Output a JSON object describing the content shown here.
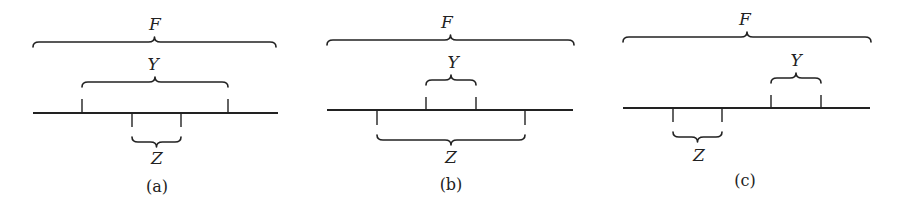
{
  "figure": {
    "panels": [
      {
        "caption": "(a)",
        "F_label": "F",
        "Y_label": "Y",
        "Z_label": "Z",
        "description": "Y contains Z",
        "line": {
          "x1": 33,
          "x2": 278,
          "y": 113
        },
        "F": {
          "x1": 33,
          "x2": 276,
          "y": 42,
          "label_x": 155,
          "label_y": 30
        },
        "Y": {
          "x1": 82,
          "x2": 228,
          "y": 82,
          "label_x": 153,
          "label_y": 70,
          "tick_top": 99
        },
        "Z": {
          "x1": 132,
          "x2": 181,
          "y": 142,
          "label_x": 157,
          "label_y": 164,
          "tick_bottom": 127
        },
        "caption_x": 157,
        "caption_y": 192
      },
      {
        "caption": "(b)",
        "F_label": "F",
        "Y_label": "Y",
        "Z_label": "Z",
        "description": "Z contains Y",
        "line": {
          "x1": 327,
          "x2": 573,
          "y": 110
        },
        "F": {
          "x1": 327,
          "x2": 574,
          "y": 40,
          "label_x": 447,
          "label_y": 28
        },
        "Y": {
          "x1": 426,
          "x2": 476,
          "y": 80,
          "label_x": 453,
          "label_y": 68,
          "tick_top": 97
        },
        "Z": {
          "x1": 377,
          "x2": 525,
          "y": 140,
          "label_x": 451,
          "label_y": 163,
          "tick_bottom": 125
        },
        "caption_x": 451,
        "caption_y": 190
      },
      {
        "caption": "(c)",
        "F_label": "F",
        "Y_label": "Y",
        "Z_label": "Z",
        "description": "Y and Z disjoint",
        "line": {
          "x1": 623,
          "x2": 870,
          "y": 108
        },
        "F": {
          "x1": 623,
          "x2": 871,
          "y": 37,
          "label_x": 745,
          "label_y": 25
        },
        "Y": {
          "x1": 771,
          "x2": 821,
          "y": 78,
          "label_x": 796,
          "label_y": 66,
          "tick_top": 95
        },
        "Z": {
          "x1": 673,
          "x2": 722,
          "y": 137,
          "label_x": 699,
          "label_y": 161,
          "tick_bottom": 122
        },
        "caption_x": 745,
        "caption_y": 186
      }
    ]
  }
}
